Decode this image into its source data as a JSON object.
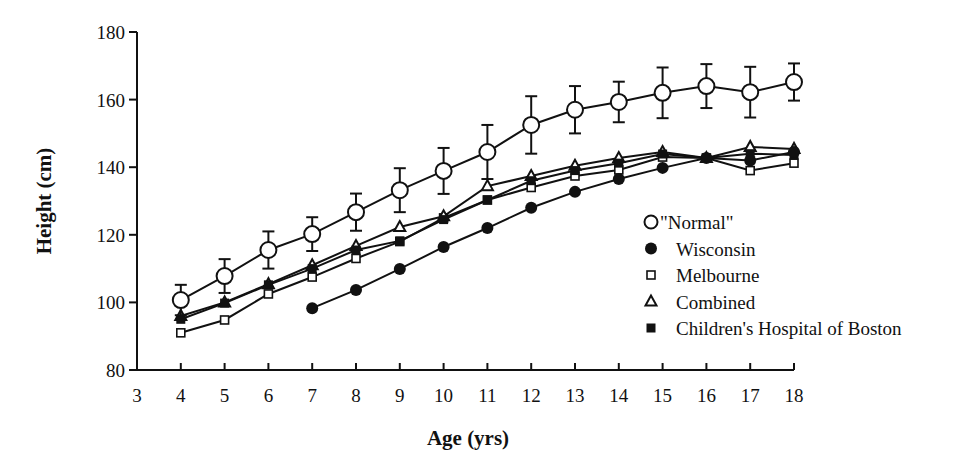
{
  "chart_data": {
    "type": "line",
    "title": "",
    "xlabel": "Age  (yrs)",
    "ylabel": "Height  (cm)",
    "xlim": [
      3,
      18
    ],
    "ylim": [
      80,
      180
    ],
    "x_ticks": [
      3,
      4,
      5,
      6,
      7,
      8,
      9,
      10,
      11,
      12,
      13,
      14,
      15,
      16,
      17,
      18
    ],
    "y_ticks": [
      80,
      100,
      120,
      140,
      160,
      180
    ],
    "grid": false,
    "legend_position": "lower right (inside plot)",
    "x": [
      4,
      5,
      6,
      7,
      8,
      9,
      10,
      11,
      12,
      13,
      14,
      15,
      16,
      17,
      18
    ],
    "series": [
      {
        "name": "\"Normal\"",
        "marker": "open-circle",
        "x": [
          4,
          5,
          6,
          7,
          8,
          9,
          10,
          11,
          12,
          13,
          14,
          15,
          16,
          17,
          18
        ],
        "values": [
          100.7,
          107.8,
          115.5,
          120.2,
          126.7,
          133.2,
          138.9,
          144.5,
          152.5,
          157.0,
          159.3,
          162.0,
          164.0,
          162.2,
          165.2
        ],
        "error": [
          4.5,
          5.0,
          5.5,
          5.0,
          5.5,
          6.5,
          6.8,
          8.0,
          8.5,
          7.0,
          6.0,
          7.5,
          6.5,
          7.5,
          5.5
        ]
      },
      {
        "name": "Wisconsin",
        "marker": "filled-circle",
        "x": [
          7,
          8,
          9,
          10,
          11,
          12,
          13,
          14,
          15,
          16,
          17,
          18
        ],
        "values": [
          98.3,
          103.7,
          109.9,
          116.4,
          122.0,
          128.0,
          132.7,
          136.5,
          139.8,
          142.7,
          142.0,
          144.5
        ]
      },
      {
        "name": "Melbourne",
        "marker": "open-square",
        "x": [
          4,
          5,
          6,
          7,
          8,
          9,
          10,
          11,
          12,
          13,
          14,
          15,
          16,
          17,
          18
        ],
        "values": [
          91.0,
          94.8,
          102.5,
          107.5,
          113.0,
          118.0,
          125.0,
          130.3,
          134.0,
          137.4,
          139.2,
          143.0,
          142.7,
          139.0,
          141.2
        ]
      },
      {
        "name": "Combined",
        "marker": "open-triangle",
        "x": [
          4,
          5,
          6,
          7,
          8,
          9,
          10,
          11,
          12,
          13,
          14,
          15,
          16,
          17,
          18
        ],
        "values": [
          96.0,
          100.0,
          105.4,
          111.0,
          116.7,
          122.3,
          125.5,
          134.4,
          137.4,
          140.4,
          142.7,
          144.5,
          142.7,
          146.0,
          145.4
        ]
      },
      {
        "name": "Children's Hospital of Boston",
        "marker": "filled-square",
        "x": [
          4,
          5,
          6,
          7,
          8,
          9,
          10,
          11,
          12,
          13,
          14,
          15,
          16,
          17,
          18
        ],
        "values": [
          95.0,
          99.8,
          105.2,
          110.0,
          115.5,
          118.2,
          124.5,
          130.3,
          136.0,
          139.0,
          141.2,
          143.9,
          142.7,
          144.0,
          143.6
        ]
      }
    ]
  },
  "axes": {
    "xlabel": "Age  (yrs)",
    "ylabel": "Height  (cm)"
  },
  "legend": [
    {
      "label": "\"Normal\"",
      "marker": "open-circle"
    },
    {
      "label": "Wisconsin",
      "marker": "filled-circle"
    },
    {
      "label": "Melbourne",
      "marker": "open-square"
    },
    {
      "label": "Combined",
      "marker": "open-triangle"
    },
    {
      "label": "Children's Hospital of Boston",
      "marker": "filled-square"
    }
  ]
}
